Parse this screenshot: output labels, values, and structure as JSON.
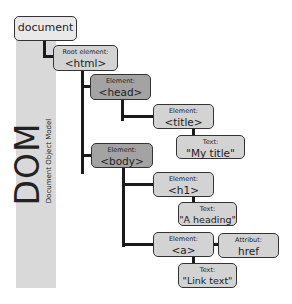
{
  "sidebar": {
    "title": "DOM",
    "subtitle": "Document Object Model",
    "band_color": "#d9d9d9"
  },
  "nodes": {
    "document": {
      "label": "document"
    },
    "html": {
      "caption": "Root element:",
      "value": "<html>"
    },
    "head": {
      "caption": "Element:",
      "value": "<head>"
    },
    "title": {
      "caption": "Element:",
      "value": "<title>"
    },
    "title_text": {
      "caption": "Text:",
      "value": "\"My title\""
    },
    "body": {
      "caption": "Element:",
      "value": "<body>"
    },
    "h1": {
      "caption": "Element:",
      "value": "<h1>"
    },
    "h1_text": {
      "caption": "Text:",
      "value": "\"A heading\""
    },
    "a": {
      "caption": "Element:",
      "value": "<a>"
    },
    "a_attr": {
      "caption": "Attribut:",
      "value": "href"
    },
    "a_text": {
      "caption": "Text:",
      "value": "\"Link text\""
    }
  },
  "colors": {
    "light_node": "#d3d3d3",
    "dark_node": "#a3a3a3",
    "document_node": "#e9e9e9",
    "connector": "#1a1a1a"
  }
}
